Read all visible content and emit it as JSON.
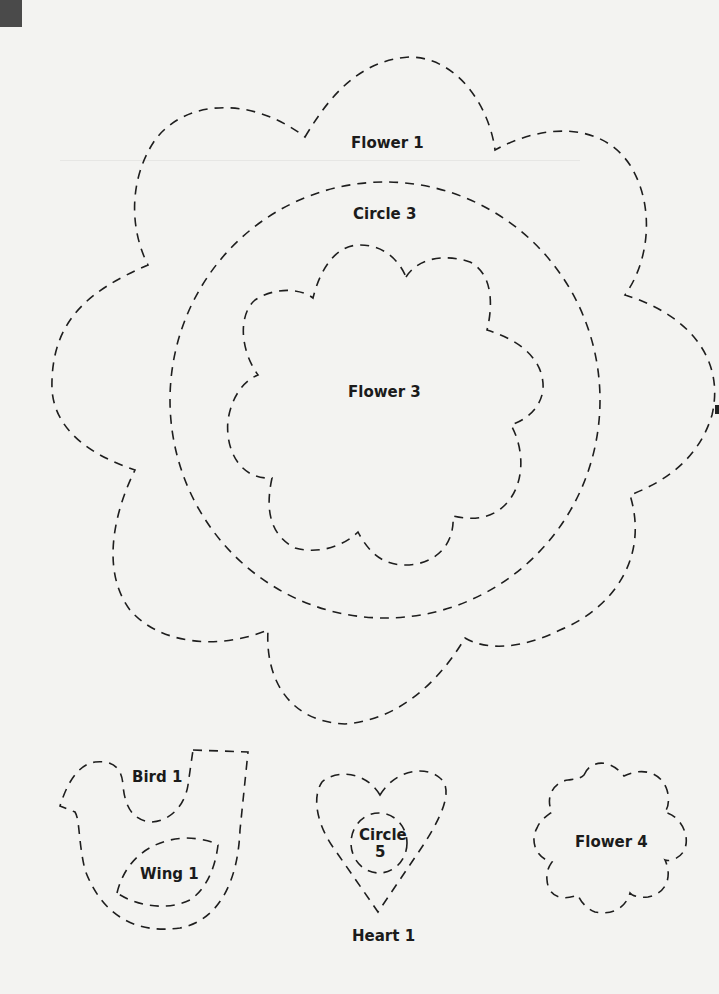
{
  "page": {
    "background": "#f3f3f1",
    "ink_color": "#1e1e1e",
    "corner_tab_color": "#4a4a4a"
  },
  "templates": {
    "flower1": {
      "label": "Flower 1"
    },
    "circle3": {
      "label": "Circle 3"
    },
    "flower3": {
      "label": "Flower 3"
    },
    "bird1": {
      "label": "Bird 1"
    },
    "wing1": {
      "label": "Wing 1"
    },
    "circle5": {
      "label_line1": "Circle",
      "label_line2": "5"
    },
    "heart1": {
      "label": "Heart 1"
    },
    "flower4": {
      "label": "Flower 4"
    }
  }
}
